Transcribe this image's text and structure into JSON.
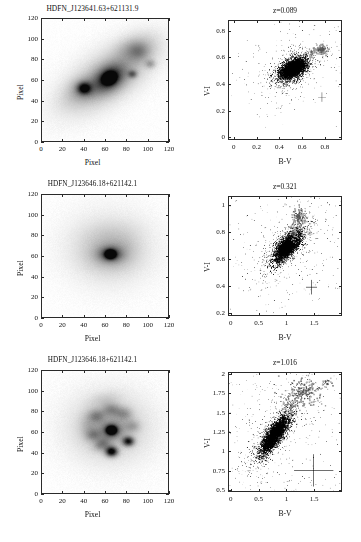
{
  "figure": {
    "layout": "3 rows x 2 columns; left column = greyscale galaxy postage stamps, right column = B-V vs V-I pixel colour-colour diagrams",
    "rows": [
      {
        "image": {
          "title": "HDFN_J123641.63+621131.9",
          "xlabel": "Pixel",
          "ylabel": "Pixel",
          "xticks": [
            "0",
            "20",
            "40",
            "60",
            "80",
            "100",
            "120"
          ],
          "yticks": [
            "0",
            "20",
            "40",
            "60",
            "80",
            "100",
            "120"
          ],
          "xlim": [
            0,
            120
          ],
          "ylim": [
            0,
            120
          ],
          "morphology": "inclined spiral / interacting disc, elongated NE-SW, bright nucleus near (64,62) with secondary knot near (40,52)"
        },
        "scatter": {
          "title": "z=0.089",
          "xlabel": "B-V",
          "ylabel": "V-I",
          "xticks": [
            "0",
            "0.2",
            "0.4",
            "0.6",
            "0.8"
          ],
          "yticks": [
            "0",
            "0.2",
            "0.4",
            "0.6",
            "0.8"
          ],
          "xlim": [
            -0.05,
            0.95
          ],
          "ylim": [
            -0.02,
            0.88
          ],
          "cloud_center": [
            0.52,
            0.52
          ],
          "cloud_spread": [
            0.11,
            0.075
          ],
          "clump_center": [
            0.77,
            0.665
          ],
          "errorbar": {
            "x": 0.78,
            "y": 0.3,
            "xerr": 0.035,
            "yerr": 0.035
          }
        }
      },
      {
        "image": {
          "title": "HDFN_J123646.18+621142.1",
          "xlabel": "Pixel",
          "ylabel": "Pixel",
          "xticks": [
            "0",
            "20",
            "40",
            "60",
            "80",
            "100",
            "120"
          ],
          "yticks": [
            "0",
            "20",
            "40",
            "60",
            "80",
            "100",
            "120"
          ],
          "xlim": [
            0,
            120
          ],
          "ylim": [
            0,
            120
          ],
          "morphology": "face-on smooth spiral with compact bright nucleus at (65,62) and faint diffuse disc"
        },
        "scatter": {
          "title": "z=0.321",
          "xlabel": "B-V",
          "ylabel": "V-I",
          "xticks": [
            "0",
            "0.5",
            "1",
            "1.5"
          ],
          "yticks": [
            "0.2",
            "0.4",
            "0.6",
            "0.8",
            "1"
          ],
          "xlim": [
            -0.05,
            2.0
          ],
          "ylim": [
            0.18,
            1.07
          ],
          "cloud_center": [
            1.02,
            0.7
          ],
          "cloud_spread": [
            0.24,
            0.115
          ],
          "clump_center": [
            1.22,
            0.92
          ],
          "errorbar": {
            "x": 1.46,
            "y": 0.39,
            "xerr": 0.1,
            "yerr": 0.055
          }
        }
      },
      {
        "image": {
          "title": "HDFN_J123646.18+621142.1",
          "xlabel": "Pixel",
          "ylabel": "Pixel",
          "xticks": [
            "0",
            "20",
            "40",
            "60",
            "80",
            "100",
            "120"
          ],
          "yticks": [
            "0",
            "20",
            "40",
            "60",
            "80",
            "100",
            "120"
          ],
          "xlim": [
            0,
            120
          ],
          "ylim": [
            0,
            120
          ],
          "morphology": "clumpy spiral with bright nucleus at (65,62) and several HII-region knots at (66,41), (82,51) and along the arms"
        },
        "scatter": {
          "title": "z=1.016",
          "xlabel": "B-V",
          "ylabel": "V-I",
          "xticks": [
            "0",
            "0.5",
            "1",
            "1.5"
          ],
          "yticks": [
            "0.5",
            "0.75",
            "1",
            "1.25",
            "1.5",
            "1.75",
            "2"
          ],
          "xlim": [
            -0.05,
            2.0
          ],
          "ylim": [
            0.48,
            2.02
          ],
          "cloud_center": [
            0.78,
            1.22
          ],
          "cloud_spread": [
            0.26,
            0.25
          ],
          "clump_center": [
            1.3,
            1.78
          ],
          "errorbar": {
            "x": 1.5,
            "y": 0.75,
            "xerr": 0.36,
            "yerr": 0.21
          }
        }
      }
    ]
  },
  "chart_data": [
    {
      "type": "scatter",
      "title": "z=0.089",
      "xlabel": "B-V",
      "ylabel": "V-I",
      "xlim": [
        -0.05,
        0.95
      ],
      "ylim": [
        -0.02,
        0.88
      ],
      "xticks": [
        0,
        0.2,
        0.4,
        0.6,
        0.8
      ],
      "yticks": [
        0,
        0.2,
        0.4,
        0.6,
        0.8
      ],
      "grid": false,
      "legend": "none",
      "series": [
        {
          "name": "galaxy pixels",
          "n_points": 2600,
          "color": "#000000",
          "distribution": "elongated blob, B-V 0.22-0.80, V-I 0.25-0.75, ridge running from (0.30,0.42) to (0.70,0.66)",
          "x_center": 0.52,
          "y_center": 0.52
        },
        {
          "name": "nuclear / reddest clump",
          "n_points": 70,
          "color": "#808080",
          "distribution": "compact grey clump at red end",
          "x_center": 0.77,
          "y_center": 0.665
        }
      ],
      "annotations": [
        {
          "type": "errorbar-cross",
          "x": 0.78,
          "y": 0.3,
          "xerr": 0.035,
          "yerr": 0.035
        }
      ]
    },
    {
      "type": "scatter",
      "title": "z=0.321",
      "xlabel": "B-V",
      "ylabel": "V-I",
      "xlim": [
        -0.05,
        2.0
      ],
      "ylim": [
        0.18,
        1.07
      ],
      "xticks": [
        0,
        0.5,
        1,
        1.5
      ],
      "yticks": [
        0.2,
        0.4,
        0.6,
        0.8,
        1
      ],
      "grid": false,
      "legend": "none",
      "series": [
        {
          "name": "galaxy pixels",
          "n_points": 2400,
          "color": "#000000",
          "distribution": "diagonal plume from (0.45,0.40) to (1.45,0.95), densest near (1.05,0.67)",
          "x_center": 1.02,
          "y_center": 0.7
        },
        {
          "name": "nuclear / reddest clump",
          "n_points": 90,
          "color": "#808080",
          "distribution": "grey clump at top of the plume",
          "x_center": 1.22,
          "y_center": 0.92
        }
      ],
      "annotations": [
        {
          "type": "errorbar-cross",
          "x": 1.46,
          "y": 0.39,
          "xerr": 0.1,
          "yerr": 0.055
        }
      ]
    },
    {
      "type": "scatter",
      "title": "z=1.016",
      "xlabel": "B-V",
      "ylabel": "V-I",
      "xlim": [
        -0.05,
        2.0
      ],
      "ylim": [
        0.48,
        2.02
      ],
      "xticks": [
        0,
        0.5,
        1,
        1.5
      ],
      "yticks": [
        0.5,
        0.75,
        1,
        1.25,
        1.5,
        1.75,
        2
      ],
      "grid": false,
      "legend": "none",
      "series": [
        {
          "name": "galaxy pixels",
          "n_points": 2300,
          "color": "#000000",
          "distribution": "broad diagonal sequence from (0.25,0.8) to (1.6,1.9), densest near (0.72,1.15)",
          "x_center": 0.78,
          "y_center": 1.22
        },
        {
          "name": "nuclear / reddest clump",
          "n_points": 130,
          "color": "#808080",
          "distribution": "grey clumps spread along upper red end",
          "x_center": 1.3,
          "y_center": 1.78
        }
      ],
      "annotations": [
        {
          "type": "errorbar-cross",
          "x": 1.5,
          "y": 0.75,
          "xerr": 0.36,
          "yerr": 0.21
        }
      ]
    }
  ]
}
